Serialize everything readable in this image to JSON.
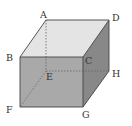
{
  "diagram": {
    "type": "cube",
    "vertices": {
      "A": {
        "x": 46,
        "y": 20
      },
      "D": {
        "x": 109,
        "y": 20
      },
      "B": {
        "x": 20,
        "y": 57
      },
      "C": {
        "x": 83,
        "y": 57
      },
      "E": {
        "x": 46,
        "y": 71
      },
      "H": {
        "x": 109,
        "y": 71
      },
      "F": {
        "x": 20,
        "y": 107
      },
      "G": {
        "x": 83,
        "y": 107
      }
    },
    "labels": {
      "A": {
        "text": "A",
        "x": 40,
        "y": 18
      },
      "D": {
        "text": "D",
        "x": 112,
        "y": 21
      },
      "B": {
        "text": "B",
        "x": 6,
        "y": 61
      },
      "C": {
        "text": "C",
        "x": 85,
        "y": 64
      },
      "E": {
        "text": "E",
        "x": 46,
        "y": 80
      },
      "H": {
        "text": "H",
        "x": 112,
        "y": 77
      },
      "F": {
        "text": "F",
        "x": 6,
        "y": 113
      },
      "G": {
        "text": "G",
        "x": 82,
        "y": 118
      }
    },
    "faces": {
      "top": {
        "color": "#e4e4e4"
      },
      "front": {
        "color": "#a9a9a9"
      },
      "right": {
        "color": "#888888"
      }
    },
    "edge_color": "#444444",
    "hidden_edge_color": "#666666",
    "hidden_edges": [
      "AE",
      "EH",
      "EF"
    ]
  }
}
